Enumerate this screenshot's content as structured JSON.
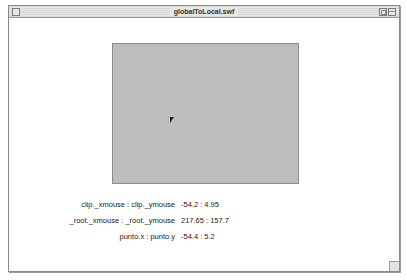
{
  "window": {
    "title": "globalToLocal.swf"
  },
  "stage": {
    "rect_color": "#bdbdbd"
  },
  "readouts": [
    {
      "label": "clip._xmouse : clip._ymouse",
      "value": "-54.2 : 4.95"
    },
    {
      "label": "_root._xmouse : _root._ymouse",
      "value": "217.65 : 157.7"
    },
    {
      "label": "punto.x : punto.y",
      "value": "-54.4 : 5.2"
    }
  ]
}
